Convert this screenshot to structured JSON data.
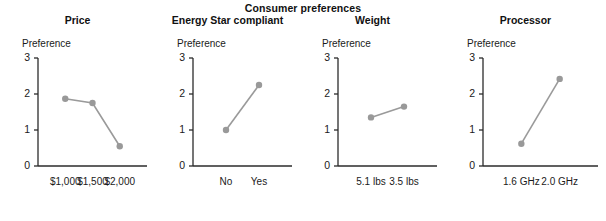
{
  "figure": {
    "title": "Consumer preferences",
    "y_axis_label": "Preference",
    "y_ticks": [
      "0",
      "1",
      "2",
      "3"
    ],
    "marker_color": "#999999",
    "line_color": "#9a9a9a",
    "axis_color": "#2b2b2b",
    "text_color": "#1a1a1a"
  },
  "chart_data": {
    "type": "line",
    "title": "Consumer preferences",
    "ylabel": "Preference",
    "xlabel": "",
    "ylim": [
      0,
      3
    ],
    "grid": false,
    "legend": "none",
    "panels": [
      {
        "title": "Price",
        "categories": [
          "$1,000",
          "$1,500",
          "$2,000"
        ],
        "values": [
          1.87,
          1.75,
          0.55
        ]
      },
      {
        "title": "Energy Star compliant",
        "categories": [
          "No",
          "Yes"
        ],
        "values": [
          1.0,
          2.25
        ]
      },
      {
        "title": "Weight",
        "categories": [
          "5.1 lbs",
          "3.5 lbs"
        ],
        "values": [
          1.35,
          1.65
        ]
      },
      {
        "title": "Processor",
        "categories": [
          "1.6 GHz",
          "2.0 GHz"
        ],
        "values": [
          0.62,
          2.42
        ]
      }
    ]
  }
}
